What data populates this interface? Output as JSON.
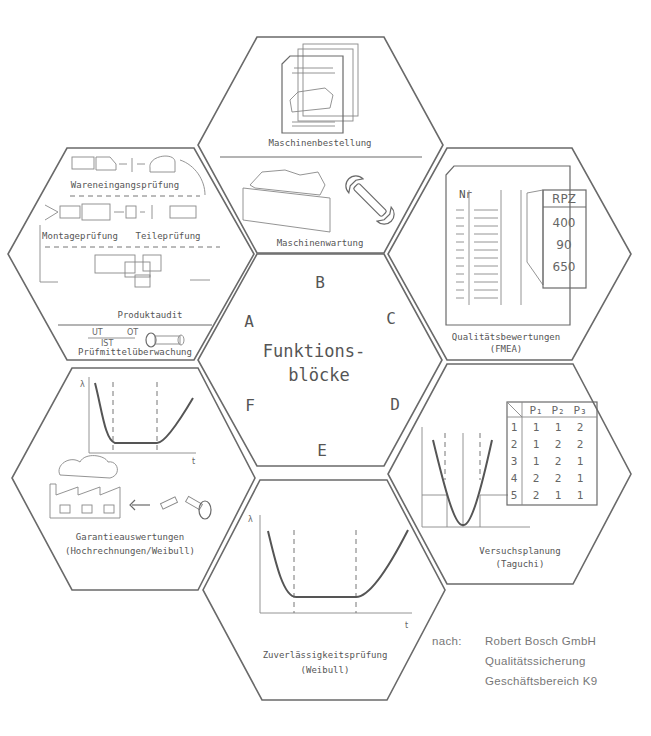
{
  "title": {
    "line1": "Funktions-",
    "line2": "blöcke"
  },
  "center_letters": {
    "A": "A",
    "B": "B",
    "C": "C",
    "D": "D",
    "E": "E",
    "F": "F"
  },
  "blocks": {
    "A": {
      "labels": [
        "Wareneingangsprüfung",
        "Montageprüfung",
        "Teileprüfung",
        "Produktaudit",
        "Prüfmittelüberwachung"
      ],
      "gauge": {
        "top_left": "UT",
        "top_right": "OT",
        "bottom": "IST"
      }
    },
    "B": {
      "labels": [
        "Maschinenbestellung",
        "Maschinenwartung"
      ]
    },
    "C": {
      "label_line1": "Qualitätsbewertungen",
      "label_line2": "(FMEA)",
      "table_header": "Nr",
      "rpz_header": "RPZ",
      "rpz_values": [
        "400",
        "90",
        "650"
      ]
    },
    "D": {
      "label_line1": "Versuchsplanung",
      "label_line2": "(Taguchi)",
      "table": {
        "columns": [
          "P₁",
          "P₂",
          "P₃"
        ],
        "rows": [
          {
            "n": "1",
            "values": [
              "1",
              "1",
              "2"
            ]
          },
          {
            "n": "2",
            "values": [
              "1",
              "2",
              "2"
            ]
          },
          {
            "n": "3",
            "values": [
              "1",
              "2",
              "1"
            ]
          },
          {
            "n": "4",
            "values": [
              "2",
              "2",
              "1"
            ]
          },
          {
            "n": "5",
            "values": [
              "2",
              "1",
              "1"
            ]
          }
        ]
      }
    },
    "E": {
      "label_line1": "Zuverlässigkeitsprüfung",
      "label_line2": "(Weibull)",
      "axis_y": "λ",
      "axis_x": "t"
    },
    "F": {
      "label_line1": "Garantieauswertungen",
      "label_line2": "(Hochrechnungen/Weibull)",
      "axis_y": "λ",
      "axis_x": "t"
    }
  },
  "credit": {
    "prefix": "nach:",
    "line1": "Robert Bosch GmbH",
    "line2": "Qualitätssicherung",
    "line3": "Geschäftsbereich K9"
  }
}
